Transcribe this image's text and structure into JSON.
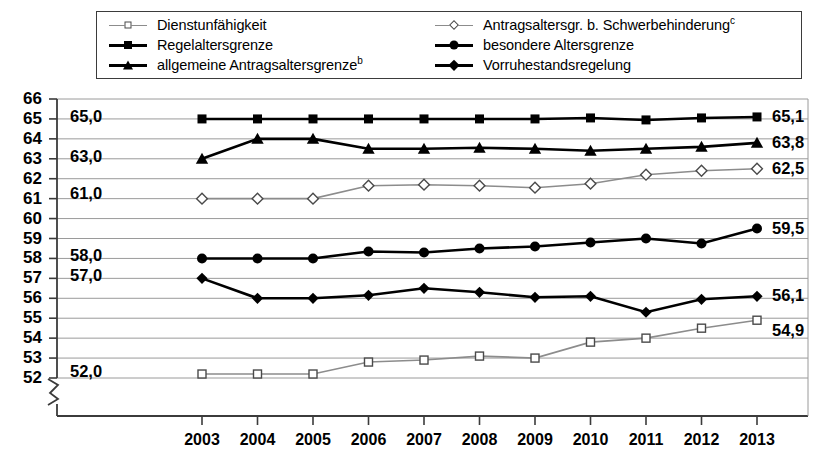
{
  "legend": {
    "items": [
      {
        "label": "Dienstunfähigkeit",
        "sup": "",
        "marker": "open-square",
        "line": "thin",
        "column": "left"
      },
      {
        "label": "Regelaltersgrenze",
        "sup": "",
        "marker": "filled-square",
        "line": "thick",
        "column": "left"
      },
      {
        "label": "allgemeine Antragsaltersgrenze",
        "sup": "b",
        "marker": "filled-triangle",
        "line": "thick",
        "column": "left"
      },
      {
        "label": "Antragsaltersgr. b. Schwerbehinderung",
        "sup": "c",
        "marker": "open-diamond",
        "line": "thin",
        "column": "right"
      },
      {
        "label": "besondere Altersgrenze",
        "sup": "",
        "marker": "filled-circle",
        "line": "thick",
        "column": "right"
      },
      {
        "label": "Vorruhestandsregelung",
        "sup": "",
        "marker": "filled-diamond",
        "line": "thick",
        "column": "right"
      }
    ]
  },
  "axis": {
    "y_ticks": [
      "66",
      "65",
      "64",
      "63",
      "62",
      "61",
      "60",
      "59",
      "58",
      "57",
      "56",
      "55",
      "54",
      "53",
      "52"
    ],
    "x_ticks": [
      "2003",
      "2004",
      "2005",
      "2006",
      "2007",
      "2008",
      "2009",
      "2010",
      "2011",
      "2012",
      "2013"
    ],
    "y_min": 52,
    "y_max": 66,
    "break_symbol": "axis-break-zigzag"
  },
  "chart_data": {
    "type": "line",
    "title": "",
    "xlabel": "",
    "ylabel": "",
    "ylim": [
      52,
      66
    ],
    "grid": true,
    "legend_position": "top",
    "x": [
      2003,
      2004,
      2005,
      2006,
      2007,
      2008,
      2009,
      2010,
      2011,
      2012,
      2013
    ],
    "categories": [
      "2003",
      "2004",
      "2005",
      "2006",
      "2007",
      "2008",
      "2009",
      "2010",
      "2011",
      "2012",
      "2013"
    ],
    "series": [
      {
        "name": "Regelaltersgrenze",
        "marker": "filled-square",
        "line": "thick",
        "values": [
          65.0,
          65.0,
          65.0,
          65.0,
          65.0,
          65.0,
          65.0,
          65.05,
          64.95,
          65.05,
          65.1
        ],
        "start_label": "65,0",
        "end_label": "65,1"
      },
      {
        "name": "allgemeine Antragsaltersgrenze",
        "marker": "filled-triangle",
        "line": "thick",
        "values": [
          63.0,
          64.0,
          64.0,
          63.5,
          63.5,
          63.55,
          63.5,
          63.4,
          63.5,
          63.6,
          63.8
        ],
        "start_label": "63,0",
        "end_label": "63,8"
      },
      {
        "name": "Antragsaltersgr. b. Schwerbehinderung",
        "marker": "open-diamond",
        "line": "thin",
        "values": [
          61.0,
          61.0,
          61.0,
          61.65,
          61.7,
          61.65,
          61.55,
          61.75,
          62.2,
          62.4,
          62.5
        ],
        "start_label": "61,0",
        "end_label": "62,5"
      },
      {
        "name": "besondere Altersgrenze",
        "marker": "filled-circle",
        "line": "thick",
        "values": [
          58.0,
          58.0,
          58.0,
          58.35,
          58.3,
          58.5,
          58.6,
          58.8,
          59.0,
          58.75,
          59.5
        ],
        "start_label": "58,0",
        "end_label": "59,5"
      },
      {
        "name": "Vorruhestandsregelung",
        "marker": "filled-diamond",
        "line": "thick",
        "values": [
          57.0,
          56.0,
          56.0,
          56.15,
          56.5,
          56.3,
          56.05,
          56.1,
          55.3,
          55.95,
          56.1
        ],
        "start_label": "57,0",
        "end_label": "56,1"
      },
      {
        "name": "Dienstunfähigkeit",
        "marker": "open-square",
        "line": "thin",
        "values": [
          52.2,
          52.2,
          52.2,
          52.8,
          52.9,
          53.1,
          53.0,
          53.8,
          54.0,
          54.5,
          54.9
        ],
        "start_label": "52,0",
        "end_label": "54,9"
      }
    ]
  },
  "colors": {
    "line_dark": "#000000",
    "line_light": "#8c8c8c",
    "grid": "#9a9a9a",
    "axis": "#3b3b3b",
    "background": "#ffffff"
  }
}
